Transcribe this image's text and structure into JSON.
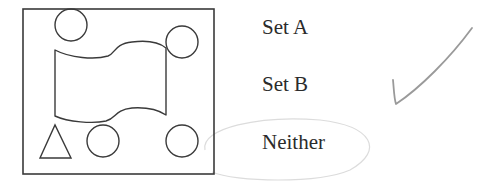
{
  "question": {
    "figure": {
      "frame": {
        "x": 23,
        "y": 9,
        "width": 191,
        "height": 165
      },
      "shapes": [
        {
          "type": "circle",
          "cx": 71,
          "cy": 25,
          "r": 16
        },
        {
          "type": "circle",
          "cx": 182,
          "cy": 42,
          "r": 16
        },
        {
          "type": "banner",
          "description": "wavy flag/banner shape"
        },
        {
          "type": "triangle",
          "points": [
            [
              40,
              158
            ],
            [
              71,
              158
            ],
            [
              55,
              125
            ]
          ]
        },
        {
          "type": "circle",
          "cx": 103,
          "cy": 141,
          "r": 16
        },
        {
          "type": "circle",
          "cx": 182,
          "cy": 141,
          "r": 16
        }
      ]
    },
    "options": [
      {
        "label": "Set A"
      },
      {
        "label": "Set B"
      },
      {
        "label": "Neither"
      }
    ],
    "annotations": {
      "checkmark_next_to": "Set B",
      "circled_option": "Neither",
      "pencil_color": "#9a9a9a"
    }
  }
}
